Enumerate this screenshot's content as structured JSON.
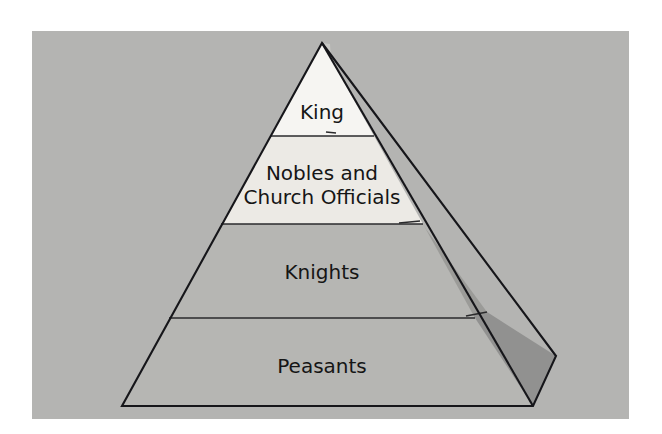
{
  "figure": {
    "plate_background": "#b4b4b2",
    "page_background": "#ffffff",
    "outline_color": "#16161a",
    "divider_color": "#2a2a2c",
    "label_color": "#151515"
  },
  "pyramid": {
    "type": "hierarchy-pyramid-3d",
    "apex": {
      "x": 322,
      "y": 43
    },
    "base_left": {
      "x": 122,
      "y": 406
    },
    "base_right": {
      "x": 533,
      "y": 406
    },
    "side_right_point": {
      "x": 556,
      "y": 356
    },
    "tier_count": 4,
    "tiers": [
      {
        "rank": 1,
        "name": "king",
        "label": "King",
        "fill": "#f6f5f2",
        "side_fill": "#c8c8c5",
        "y_top": 43,
        "y_bottom": 136,
        "label_x": 322,
        "label_y": 113
      },
      {
        "rank": 2,
        "name": "nobles-and-church-officials",
        "label": "Nobles and\nChurch Officials",
        "label_line_1": "Nobles and",
        "label_line_2": "Church Officials",
        "fill": "#eceae5",
        "side_fill": "#a6a6a3",
        "y_top": 136,
        "y_bottom": 224,
        "label_x": 322,
        "label_y": 185
      },
      {
        "rank": 3,
        "name": "knights",
        "label": "Knights",
        "fill": "#b6b6b3",
        "side_fill": "#9b9b98",
        "y_top": 224,
        "y_bottom": 318,
        "label_x": 322,
        "label_y": 273
      },
      {
        "rank": 4,
        "name": "peasants",
        "label": "Peasants",
        "fill": "#b6b6b3",
        "side_fill": "#919190",
        "y_top": 318,
        "y_bottom": 406,
        "label_x": 322,
        "label_y": 367
      }
    ]
  }
}
